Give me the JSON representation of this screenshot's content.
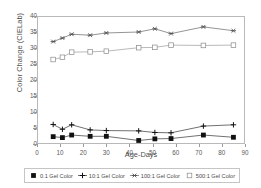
{
  "chart_data": {
    "type": "line",
    "title": "",
    "xlabel": "Age-Days",
    "ylabel": "Color Change (CIELab)",
    "xlim": [
      0,
      90
    ],
    "ylim": [
      0,
      40
    ],
    "xticks": [
      0,
      10,
      20,
      30,
      40,
      50,
      60,
      70,
      80,
      90
    ],
    "yticks": [
      0,
      5,
      10,
      15,
      20,
      25,
      30,
      35,
      40
    ],
    "grid": false,
    "legend_position": "bottom",
    "x": [
      7,
      11,
      15,
      23,
      30,
      44,
      51,
      58,
      72,
      85
    ],
    "series": [
      {
        "name": "0.1 Gel Color",
        "marker": "filled-square",
        "color": "#111111",
        "values": [
          2.3,
          2.0,
          2.8,
          2.4,
          2.4,
          1.1,
          1.6,
          1.7,
          2.8,
          2.1
        ]
      },
      {
        "name": "10:1 Gel Color",
        "marker": "plus",
        "color": "#111111",
        "values": [
          6.1,
          4.6,
          6.0,
          4.4,
          4.2,
          4.1,
          3.6,
          3.5,
          5.6,
          6.0
        ]
      },
      {
        "name": "100:1 Gel Color",
        "marker": "asterisk",
        "color": "#4d4d4d",
        "values": [
          32.0,
          33.1,
          34.3,
          34.0,
          34.7,
          35.0,
          36.0,
          34.5,
          36.6,
          35.4
        ]
      },
      {
        "name": "500:1 Gel Color",
        "marker": "open-square",
        "color": "#8a8a8a",
        "values": [
          26.4,
          27.1,
          28.7,
          28.8,
          29.0,
          30.1,
          30.2,
          30.9,
          30.8,
          30.9
        ]
      }
    ]
  }
}
